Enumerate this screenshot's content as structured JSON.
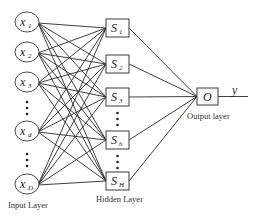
{
  "diagram": {
    "type": "neural-network",
    "input_layer": {
      "label": "Input Layer",
      "nodes": [
        {
          "id": "x1",
          "symbol": "x",
          "subscript": "1",
          "cx": 27,
          "cy": 22
        },
        {
          "id": "x2",
          "symbol": "x",
          "subscript": "2",
          "cx": 27,
          "cy": 52
        },
        {
          "id": "x3",
          "symbol": "x",
          "subscript": "3",
          "cx": 27,
          "cy": 82
        },
        {
          "id": "xd",
          "symbol": "x",
          "subscript": "d",
          "cx": 27,
          "cy": 131
        },
        {
          "id": "xD",
          "symbol": "x",
          "subscript": "D",
          "cx": 27,
          "cy": 184
        }
      ],
      "ellipsis_positions": [
        {
          "x": 27,
          "ys": [
            102,
            108,
            114
          ]
        },
        {
          "x": 27,
          "ys": [
            154,
            160,
            166
          ]
        }
      ]
    },
    "hidden_layer": {
      "label": "Hidden Layer",
      "nodes": [
        {
          "id": "S1",
          "symbol": "S",
          "subscript": "1",
          "x": 106,
          "y": 19,
          "w": 23,
          "h": 18
        },
        {
          "id": "S2",
          "symbol": "S",
          "subscript": "2",
          "x": 106,
          "y": 55,
          "w": 23,
          "h": 18
        },
        {
          "id": "S3",
          "symbol": "S",
          "subscript": "3",
          "x": 106,
          "y": 88,
          "w": 23,
          "h": 18
        },
        {
          "id": "Sh",
          "symbol": "S",
          "subscript": "h",
          "x": 106,
          "y": 131,
          "w": 23,
          "h": 18
        },
        {
          "id": "SH",
          "symbol": "S",
          "subscript": "H",
          "x": 106,
          "y": 172,
          "w": 23,
          "h": 18
        }
      ],
      "ellipsis_positions": [
        {
          "x": 117.5,
          "ys": [
            113,
            119,
            125
          ]
        },
        {
          "x": 117.5,
          "ys": [
            156,
            162,
            168
          ]
        }
      ]
    },
    "output_layer": {
      "label": "Output layer",
      "node": {
        "id": "O",
        "symbol": "O",
        "x": 197,
        "y": 88,
        "w": 21,
        "h": 17
      },
      "output": {
        "symbol": "y",
        "line_to_x": 248
      }
    },
    "connectivity": "fully-connected input→hidden; all hidden→output"
  }
}
